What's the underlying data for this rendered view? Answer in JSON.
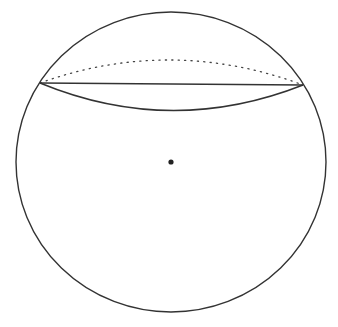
{
  "diagram": {
    "title": "",
    "colors": {
      "stroke": "#333333",
      "background": "#ffffff",
      "center": "#222222"
    },
    "sphere": {
      "cx": 171,
      "cy": 162,
      "rx": 155,
      "ry": 150
    },
    "section": {
      "cx": 171,
      "cy": 84,
      "rx": 132,
      "ry_front": 26,
      "ry_back": 24,
      "visible_edge": "solid",
      "hidden_edge": "dotted"
    },
    "center_point": {
      "cx": 171,
      "cy": 162,
      "r": 2.6
    }
  }
}
